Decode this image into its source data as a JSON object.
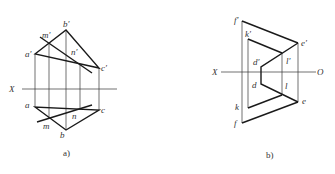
{
  "figures": [
    {
      "id": "a",
      "caption": "a)",
      "axis_label": "X",
      "labels": {
        "b_prime": "b′",
        "m_prime": "m′",
        "n_prime": "n′",
        "a_prime": "a′",
        "c_prime": "c′",
        "a": "a",
        "c": "c",
        "n": "n",
        "m": "m",
        "b": "b"
      }
    },
    {
      "id": "b",
      "caption": "b)",
      "axis_label_left": "X",
      "axis_label_right": "O",
      "labels": {
        "f_prime": "f′",
        "k_prime": "k′",
        "e_prime": "e′",
        "d_prime": "d′",
        "l_prime": "l′",
        "d": "d",
        "l": "l",
        "k": "k",
        "e": "e",
        "f": "f"
      }
    }
  ]
}
